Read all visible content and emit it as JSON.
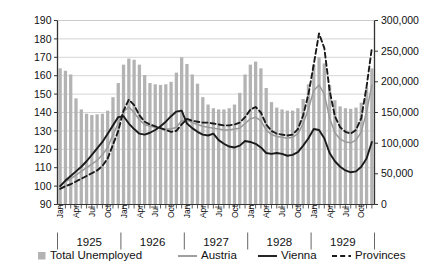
{
  "chart_data": {
    "type": "bar",
    "title": "",
    "subtitle": "",
    "xlabel": "",
    "ylabel": "",
    "grid": true,
    "legend_position": "bottom",
    "x": [
      "Jan 1925",
      "Feb 1925",
      "Mar 1925",
      "Apr 1925",
      "May 1925",
      "Jun 1925",
      "Jul 1925",
      "Aug 1925",
      "Sep 1925",
      "Oct 1925",
      "Nov 1925",
      "Dec 1925",
      "Jan 1926",
      "Feb 1926",
      "Mar 1926",
      "Apr 1926",
      "May 1926",
      "Jun 1926",
      "Jul 1926",
      "Aug 1926",
      "Sep 1926",
      "Oct 1926",
      "Nov 1926",
      "Dec 1926",
      "Jan 1927",
      "Feb 1927",
      "Mar 1927",
      "Apr 1927",
      "May 1927",
      "Jun 1927",
      "Jul 1927",
      "Aug 1927",
      "Sep 1927",
      "Oct 1927",
      "Nov 1927",
      "Dec 1927",
      "Jan 1928",
      "Feb 1928",
      "Mar 1928",
      "Apr 1928",
      "May 1928",
      "Jun 1928",
      "Jul 1928",
      "Aug 1928",
      "Sep 1928",
      "Oct 1928",
      "Nov 1928",
      "Dec 1928",
      "Jan 1929",
      "Feb 1929",
      "Mar 1929",
      "Apr 1929",
      "May 1929",
      "Jun 1929",
      "Jul 1929",
      "Aug 1929",
      "Sep 1929",
      "Oct 1929",
      "Nov 1929",
      "Dec 1929"
    ],
    "years": [
      "1925",
      "1926",
      "1927",
      "1928",
      "1929"
    ],
    "months_labeled": [
      "Jan",
      "Apr",
      "Jul",
      "Oct"
    ],
    "axes": {
      "left": {
        "title": "",
        "min": 90,
        "max": 190,
        "step": 10,
        "ticks": [
          90,
          100,
          110,
          120,
          130,
          140,
          150,
          160,
          170,
          180,
          190
        ],
        "tick_labels": [
          "90",
          "100",
          "110",
          "120",
          "130",
          "140",
          "150",
          "160",
          "170",
          "180",
          "190"
        ]
      },
      "right": {
        "title": "",
        "min": 0,
        "max": 300000,
        "step": 50000,
        "ticks": [
          0,
          50000,
          100000,
          150000,
          200000,
          250000,
          300000
        ],
        "tick_labels": [
          "0",
          "50,000",
          "100,000",
          "150,000",
          "200,000",
          "250,000",
          "300,000"
        ]
      }
    },
    "series": [
      {
        "name": "Total Unemployed",
        "type": "bar",
        "axis": "right",
        "color": "#b3b3b3",
        "values": [
          222000,
          218000,
          212000,
          173000,
          155000,
          148000,
          146000,
          147000,
          148000,
          153000,
          175000,
          198000,
          228000,
          238000,
          236000,
          228000,
          211000,
          198000,
          196000,
          195000,
          196000,
          200000,
          215000,
          240000,
          229000,
          212000,
          197000,
          175000,
          163000,
          157000,
          155000,
          155000,
          157000,
          163000,
          182000,
          212000,
          228000,
          233000,
          222000,
          190000,
          167000,
          158000,
          155000,
          153000,
          153000,
          157000,
          172000,
          196000,
          228000,
          240000,
          230000,
          195000,
          170000,
          160000,
          157000,
          156000,
          158000,
          166000,
          190000,
          222000
        ]
      },
      {
        "name": "Austria",
        "type": "line",
        "style": "solid",
        "axis": "left",
        "color": "#9a9a9a",
        "values": [
          100.0,
          102.5,
          104.0,
          106.0,
          108.0,
          110.0,
          112.0,
          114.0,
          117.0,
          121.0,
          128.0,
          134.0,
          140.5,
          143.0,
          140.0,
          136.0,
          133.5,
          132.5,
          132.0,
          131.5,
          131.0,
          131.0,
          132.0,
          135.5,
          136.0,
          134.5,
          133.5,
          132.5,
          132.0,
          131.5,
          131.0,
          130.5,
          130.5,
          131.0,
          131.5,
          134.0,
          136.5,
          137.5,
          135.5,
          130.5,
          128.0,
          127.0,
          126.5,
          126.0,
          126.5,
          128.5,
          134.0,
          142.0,
          152.0,
          155.0,
          150.0,
          137.0,
          129.0,
          125.5,
          124.0,
          123.5,
          125.0,
          129.5,
          140.5,
          155.0
        ]
      },
      {
        "name": "Vienna",
        "type": "line",
        "style": "solid",
        "axis": "left",
        "color": "#1a1a1a",
        "values": [
          100.0,
          103.0,
          105.5,
          108.0,
          110.5,
          113.5,
          117.0,
          120.5,
          124.0,
          128.5,
          133.0,
          137.5,
          138.0,
          134.0,
          131.0,
          128.5,
          128.0,
          129.0,
          130.5,
          132.5,
          135.0,
          138.0,
          140.5,
          141.0,
          134.0,
          131.5,
          129.5,
          128.0,
          127.5,
          128.5,
          125.0,
          123.0,
          121.5,
          121.0,
          122.0,
          124.5,
          124.0,
          123.0,
          121.0,
          118.0,
          117.5,
          118.0,
          117.5,
          116.5,
          117.0,
          118.5,
          122.0,
          126.0,
          131.0,
          130.5,
          126.0,
          118.0,
          113.5,
          110.5,
          108.5,
          107.5,
          108.0,
          110.5,
          115.0,
          124.0
        ]
      },
      {
        "name": "Provinces",
        "type": "line",
        "style": "dashed",
        "axis": "left",
        "color": "#1a1a1a",
        "values": [
          98.5,
          100.0,
          101.0,
          102.5,
          104.0,
          105.5,
          107.0,
          108.5,
          111.0,
          115.0,
          122.5,
          130.0,
          141.0,
          147.0,
          144.0,
          138.5,
          135.0,
          133.5,
          132.5,
          131.5,
          130.5,
          129.5,
          130.0,
          133.5,
          136.5,
          135.5,
          135.0,
          134.5,
          134.5,
          134.0,
          133.5,
          133.0,
          133.0,
          133.5,
          134.5,
          137.5,
          141.5,
          143.0,
          140.0,
          133.5,
          130.0,
          128.5,
          128.0,
          127.5,
          128.0,
          131.0,
          138.5,
          150.0,
          166.0,
          183.0,
          175.0,
          152.0,
          138.0,
          132.0,
          129.5,
          128.5,
          130.5,
          137.0,
          154.0,
          175.0
        ]
      }
    ],
    "legend": [
      {
        "label": "Total Unemployed",
        "marker": "square",
        "color": "#b3b3b3"
      },
      {
        "label": "Austria",
        "marker": "line-solid",
        "color": "#9a9a9a"
      },
      {
        "label": "Vienna",
        "marker": "line-solid",
        "color": "#1a1a1a"
      },
      {
        "label": "Provinces",
        "marker": "line-dashed",
        "color": "#1a1a1a"
      }
    ]
  }
}
